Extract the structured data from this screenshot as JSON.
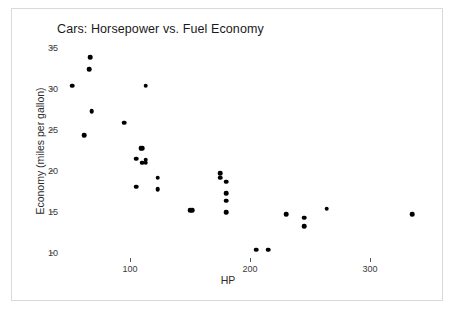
{
  "chart_data": {
    "type": "scatter",
    "title": "Cars: Horsepower vs. Fuel Economy",
    "xlabel": "HP",
    "ylabel": "Economy (miles per gallon)",
    "xlim": [
      40,
      360
    ],
    "ylim": [
      8.5,
      36
    ],
    "xticks": [
      100,
      200,
      300
    ],
    "yticks": [
      10,
      15,
      20,
      25,
      30,
      35
    ],
    "grid": false,
    "legend": null,
    "marker": {
      "shape": "circle",
      "color": "#000000",
      "size": 4.6
    },
    "points": [
      {
        "x": 67,
        "y": 33.9
      },
      {
        "x": 66,
        "y": 32.4
      },
      {
        "x": 52,
        "y": 30.4
      },
      {
        "x": 113,
        "y": 30.4
      },
      {
        "x": 68,
        "y": 27.3
      },
      {
        "x": 95,
        "y": 25.9
      },
      {
        "x": 62,
        "y": 24.4
      },
      {
        "x": 109,
        "y": 22.8
      },
      {
        "x": 110,
        "y": 22.8
      },
      {
        "x": 105,
        "y": 21.5
      },
      {
        "x": 113,
        "y": 21.4
      },
      {
        "x": 113,
        "y": 21.0
      },
      {
        "x": 110,
        "y": 21.0
      },
      {
        "x": 123,
        "y": 19.2
      },
      {
        "x": 175,
        "y": 19.7
      },
      {
        "x": 175,
        "y": 19.2
      },
      {
        "x": 180,
        "y": 18.7
      },
      {
        "x": 105,
        "y": 18.1
      },
      {
        "x": 123,
        "y": 17.8
      },
      {
        "x": 180,
        "y": 17.3
      },
      {
        "x": 180,
        "y": 16.4
      },
      {
        "x": 150,
        "y": 15.2
      },
      {
        "x": 152,
        "y": 15.2
      },
      {
        "x": 180,
        "y": 15.0
      },
      {
        "x": 264,
        "y": 15.4
      },
      {
        "x": 230,
        "y": 14.7
      },
      {
        "x": 335,
        "y": 14.7
      },
      {
        "x": 245,
        "y": 14.3
      },
      {
        "x": 245,
        "y": 13.3
      },
      {
        "x": 205,
        "y": 10.4
      },
      {
        "x": 215,
        "y": 10.4
      }
    ]
  },
  "axes": {
    "y_tick_labels": [
      "35",
      "30",
      "25",
      "20",
      "15",
      "10"
    ],
    "x_tick_labels": [
      "100",
      "200",
      "300"
    ]
  }
}
